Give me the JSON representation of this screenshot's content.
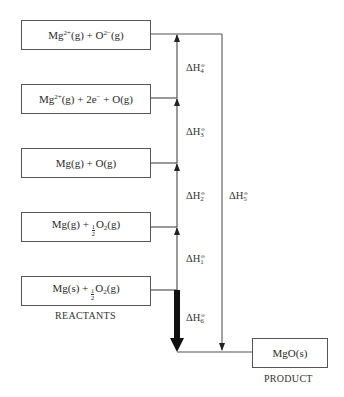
{
  "diagram": {
    "type": "Born-Haber cycle (enthalpy level diagram)",
    "levels": [
      {
        "id": "L1",
        "species": "Mg",
        "charge1": "2+",
        "mid": "(g) + O",
        "charge2": "2−",
        "tail": "(g)",
        "text": "Mg2+(g) + O2−(g)"
      },
      {
        "id": "L2",
        "text": "Mg2+(g) + 2e− + O(g)",
        "a": "Mg",
        "b": "2+",
        "c": "(g) + 2e",
        "d": "−",
        "e": " + O(g)"
      },
      {
        "id": "L3",
        "text": "Mg(g) + O(g)"
      },
      {
        "id": "L4",
        "text": "Mg(g) + ½O2(g)",
        "pre": "Mg(g) + ",
        "num": "1",
        "den": "2",
        "o": "O",
        "sub": "2",
        "post": "(g)"
      },
      {
        "id": "L5",
        "text": "Mg(s) + ½O2(g)",
        "pre": "Mg(s) + ",
        "num": "1",
        "den": "2",
        "o": "O",
        "sub": "2",
        "post": "(g)"
      }
    ],
    "reactants_label": "REACTANTS",
    "product": {
      "text": "MgO(s)",
      "label": "PRODUCT"
    },
    "enthalpy_changes": [
      {
        "symbol": "ΔH",
        "sub": "1",
        "sup": "⦵",
        "from": "L5",
        "to": "L4",
        "direction": "up"
      },
      {
        "symbol": "ΔH",
        "sub": "2",
        "sup": "⦵",
        "from": "L4",
        "to": "L3",
        "direction": "up"
      },
      {
        "symbol": "ΔH",
        "sub": "3",
        "sup": "⦵",
        "from": "L3",
        "to": "L2",
        "direction": "up"
      },
      {
        "symbol": "ΔH",
        "sub": "4",
        "sup": "⦵",
        "from": "L2",
        "to": "L1",
        "direction": "up"
      },
      {
        "symbol": "ΔH",
        "sub": "5",
        "sup": "⦵",
        "from": "L1",
        "to": "MgO(s)",
        "direction": "down"
      },
      {
        "symbol": "ΔH",
        "sub": "6",
        "sup": "⦵",
        "from": "L5",
        "to": "MgO(s)",
        "direction": "down",
        "emphasis": "bold"
      }
    ],
    "colors": {
      "line": "#555555",
      "text": "#2a2a2a",
      "bold_arrow": "#111111"
    }
  }
}
